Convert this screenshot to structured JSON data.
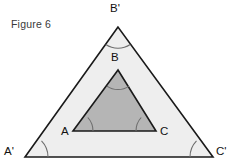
{
  "figure": {
    "caption": "Figure 6",
    "colors": {
      "outer_fill": "#eeeeee",
      "inner_fill": "#b5b5b5",
      "stroke": "#1a1a1a",
      "arc_stroke": "#6e6e6e",
      "background": "#ffffff",
      "label_color": "#111111",
      "caption_color": "#3a3a3a"
    },
    "outer_triangle": {
      "name": "A'B'C'",
      "vertices": [
        {
          "label": "B'",
          "x": 118,
          "y": 27
        },
        {
          "label": "A'",
          "x": 25,
          "y": 157
        },
        {
          "label": "C'",
          "x": 213,
          "y": 157
        }
      ]
    },
    "inner_triangle": {
      "name": "ABC",
      "vertices": [
        {
          "label": "B",
          "x": 118,
          "y": 70
        },
        {
          "label": "A",
          "x": 73,
          "y": 131
        },
        {
          "label": "C",
          "x": 156,
          "y": 131
        }
      ]
    },
    "angle_marks": [
      {
        "at": "B'",
        "kind": "arc"
      },
      {
        "at": "A'",
        "kind": "arc"
      },
      {
        "at": "C'",
        "kind": "arc"
      },
      {
        "at": "B",
        "kind": "arc"
      },
      {
        "at": "A",
        "kind": "arc"
      },
      {
        "at": "C",
        "kind": "arc"
      }
    ]
  }
}
